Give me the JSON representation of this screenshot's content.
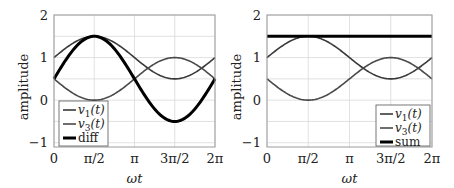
{
  "chart_data": [
    {
      "type": "line",
      "panel": "left",
      "title": "",
      "xlabel": "ωt",
      "ylabel": "amplitude",
      "xlim": [
        0,
        6.2832
      ],
      "ylim": [
        -1.1,
        2
      ],
      "grid": true,
      "xticks": [
        0,
        1.5708,
        3.1416,
        4.7124,
        6.2832
      ],
      "xtick_labels": [
        "0",
        "π/2",
        "π",
        "3π/2",
        "2π"
      ],
      "yticks": [
        -1,
        0,
        1,
        2
      ],
      "ytick_labels": [
        "−1",
        "0",
        "1",
        "2"
      ],
      "legend_position": "lower left",
      "x": [
        0,
        1.5708,
        3.1416,
        4.7124,
        6.2832
      ],
      "series": [
        {
          "name": "v1(t)",
          "label_main": "v",
          "label_sub": "1",
          "label_arg": "(t)",
          "formula": "1 + 0.5 sin(ωt)",
          "values": [
            1,
            1.5,
            1,
            0.5,
            1
          ],
          "color": "#3a3a3a",
          "width": 1.6
        },
        {
          "name": "v3(t)",
          "label_main": "v",
          "label_sub": "3",
          "label_arg": "(t)",
          "formula": "0.5 − 0.5 sin(ωt)",
          "values": [
            0.5,
            0,
            0.5,
            1,
            0.5
          ],
          "color": "#4a4a4a",
          "width": 1.6
        },
        {
          "name": "diff",
          "label_main": "diff",
          "formula": "v1 − v3 = 0.5 + sin(ωt)",
          "values": [
            0.5,
            1.5,
            0.5,
            -0.5,
            0.5
          ],
          "color": "#000000",
          "width": 3
        }
      ]
    },
    {
      "type": "line",
      "panel": "right",
      "title": "",
      "xlabel": "ωt",
      "ylabel": "amplitude",
      "xlim": [
        0,
        6.2832
      ],
      "ylim": [
        -1.1,
        2
      ],
      "grid": true,
      "xticks": [
        0,
        1.5708,
        3.1416,
        4.7124,
        6.2832
      ],
      "xtick_labels": [
        "0",
        "π/2",
        "π",
        "3π/2",
        "2π"
      ],
      "yticks": [
        -1,
        0,
        1,
        2
      ],
      "ytick_labels": [
        "−1",
        "0",
        "1",
        "2"
      ],
      "legend_position": "lower right",
      "x": [
        0,
        1.5708,
        3.1416,
        4.7124,
        6.2832
      ],
      "series": [
        {
          "name": "v1(t)",
          "label_main": "v",
          "label_sub": "1",
          "label_arg": "(t)",
          "formula": "1 + 0.5 sin(ωt)",
          "values": [
            1,
            1.5,
            1,
            0.5,
            1
          ],
          "color": "#3a3a3a",
          "width": 1.6
        },
        {
          "name": "v3(t)",
          "label_main": "v",
          "label_sub": "3",
          "label_arg": "(t)",
          "formula": "0.5 − 0.5 sin(ωt)",
          "values": [
            0.5,
            0,
            0.5,
            1,
            0.5
          ],
          "color": "#4a4a4a",
          "width": 1.6
        },
        {
          "name": "sum",
          "label_main": "sum",
          "formula": "v1 + v3 = 1.5",
          "values": [
            1.5,
            1.5,
            1.5,
            1.5,
            1.5
          ],
          "color": "#000000",
          "width": 3
        }
      ]
    }
  ],
  "colors": {
    "grid": "#d9d9d9",
    "frame": "#9a9a9a",
    "text": "#222222"
  }
}
